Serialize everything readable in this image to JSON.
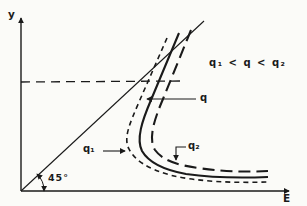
{
  "figure": {
    "type": "qualitative-plot",
    "background": "#fbfbf8",
    "ink": "#1a1a1a",
    "axes": {
      "y_label": "y",
      "x_label": "E"
    },
    "labels": {
      "angle": "45°",
      "curve_q": "q",
      "curve_q1": "q₁",
      "curve_q2": "q₂",
      "inequality": "q₁ < q < q₂"
    },
    "elements": {
      "diagonal_line": "45-degree line from origin",
      "horizontal_guide": "dashed horizontal level line from y-axis",
      "curves": [
        {
          "name": "q1",
          "label": "q₁",
          "style": "short-dashed",
          "position": "outer"
        },
        {
          "name": "q",
          "label": "q",
          "style": "solid",
          "position": "middle"
        },
        {
          "name": "q2",
          "label": "q₂",
          "style": "long-dashed",
          "position": "inner"
        }
      ]
    }
  }
}
